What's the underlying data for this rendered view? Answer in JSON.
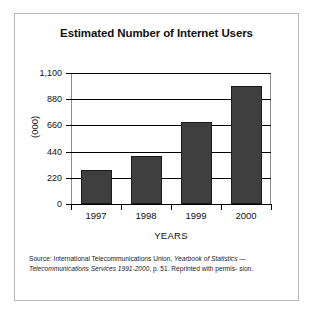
{
  "chart_data": {
    "type": "bar",
    "title": "Estimated Number of Internet Users",
    "categories": [
      "1997",
      "1998",
      "1999",
      "2000"
    ],
    "values": [
      285,
      400,
      690,
      990
    ],
    "xlabel": "YEARS",
    "ylabel": "(000)",
    "ylim": [
      0,
      1100
    ],
    "yticks": [
      "0",
      "220",
      "440",
      "660",
      "880",
      "1,100"
    ],
    "ytick_values": [
      0,
      220,
      440,
      660,
      880,
      1100
    ],
    "grid": true,
    "legend": null,
    "bar_color": "#3f3f3f",
    "bar_edge_color": "#1a1a1a"
  },
  "source": {
    "line1_prefix": "Source: International Telecommunications Union,  ",
    "line1_italic": "Yearbook of Statistics",
    "line2_dash": "— ",
    "line2_italic": "Telecommunications Services 1991-2000",
    "line2_rest": ", p. 51. Reprinted with permis-",
    "line3": "sion."
  },
  "frame": {
    "border_color": "#b9b9b9",
    "background": "#ffffff"
  }
}
